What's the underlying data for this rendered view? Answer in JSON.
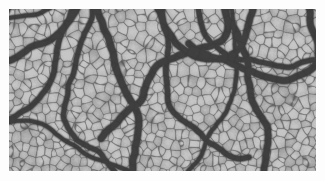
{
  "page": {
    "background_color": "#fdfdfd",
    "width": 325,
    "height": 181
  },
  "figure": {
    "name": "elephant-skin-leather-texture",
    "alt_text": "Grayscale macro photograph of elephant hide / pebble-grain leather showing irregular polygonal cells separated by dark branching cracks",
    "color_mode": "grayscale",
    "frame": {
      "left": 9,
      "top": 9,
      "width": 307,
      "height": 162,
      "border": "none"
    },
    "palette": {
      "cell_highlight": "#c6c6c6",
      "cell_midtone": "#9b9b9b",
      "cell_base": "#8d8d8d",
      "crack_shadow": "#4e4e4e",
      "crack_deep": "#3a3a3a",
      "background": "#fdfdfd"
    },
    "texture": {
      "cell_count_approx": 1900,
      "cell_size_px": 9,
      "cell_size_variation": 0.45,
      "crack_width_px": 1.6,
      "major_crack_count": 14,
      "grain_noise_amount": 0.16,
      "upper_region_note": "coarser cells with long vertical and diagonal deep cracks",
      "lower_region_note": "finer rounded pebble cells with denser crack network",
      "seed": 20240517
    }
  }
}
